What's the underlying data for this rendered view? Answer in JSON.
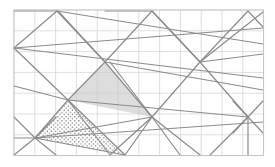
{
  "figure": {
    "caption": "",
    "background_color": "#ffffff",
    "canvas": {
      "width": 275,
      "height": 167
    }
  },
  "grid": {
    "label": "square-grid",
    "origin_x": 14,
    "origin_y": 10,
    "cell_size": 20.8,
    "columns": 12,
    "rows": 7,
    "right": 263.6,
    "bottom": 155.6,
    "line_color": "#d3d3d3",
    "line_width": 0.7,
    "border_color": "#bfbfbf",
    "border_width": 0.8
  },
  "lines": {
    "label": "lattice-lines",
    "color": "#8c8c8c",
    "width": 1.2,
    "segments": [
      {
        "name": "seg-1",
        "x1": 14,
        "y1": 48,
        "x2": 57,
        "y2": 11
      },
      {
        "name": "seg-2",
        "x1": 14,
        "y1": 48,
        "x2": 68,
        "y2": 100
      },
      {
        "name": "seg-3",
        "x1": 14,
        "y1": 48,
        "x2": 263,
        "y2": 28
      },
      {
        "name": "seg-4",
        "x1": 14,
        "y1": 48,
        "x2": 263,
        "y2": 78
      },
      {
        "name": "seg-5",
        "x1": 57,
        "y1": 11,
        "x2": 105,
        "y2": 62
      },
      {
        "name": "seg-6",
        "x1": 57,
        "y1": 11,
        "x2": 263,
        "y2": 44
      },
      {
        "name": "seg-7",
        "x1": 105,
        "y1": 62,
        "x2": 152,
        "y2": 11
      },
      {
        "name": "seg-8",
        "x1": 105,
        "y1": 62,
        "x2": 152,
        "y2": 117
      },
      {
        "name": "seg-9",
        "x1": 105,
        "y1": 62,
        "x2": 68,
        "y2": 100
      },
      {
        "name": "seg-10",
        "x1": 105,
        "y1": 62,
        "x2": 263,
        "y2": 90
      },
      {
        "name": "seg-11",
        "x1": 152,
        "y1": 11,
        "x2": 200,
        "y2": 62
      },
      {
        "name": "seg-12",
        "x1": 152,
        "y1": 11,
        "x2": 105,
        "y2": 11
      },
      {
        "name": "seg-13",
        "x1": 200,
        "y1": 62,
        "x2": 248,
        "y2": 11
      },
      {
        "name": "seg-14",
        "x1": 200,
        "y1": 62,
        "x2": 248,
        "y2": 117
      },
      {
        "name": "seg-15",
        "x1": 200,
        "y1": 62,
        "x2": 152,
        "y2": 117
      },
      {
        "name": "seg-16",
        "x1": 200,
        "y1": 62,
        "x2": 263,
        "y2": 54
      },
      {
        "name": "seg-17",
        "x1": 248,
        "y1": 11,
        "x2": 263,
        "y2": 27
      },
      {
        "name": "seg-18",
        "x1": 248,
        "y1": 117,
        "x2": 263,
        "y2": 101
      },
      {
        "name": "seg-19",
        "x1": 248,
        "y1": 117,
        "x2": 263,
        "y2": 133
      },
      {
        "name": "seg-20",
        "x1": 248,
        "y1": 117,
        "x2": 233,
        "y2": 101
      },
      {
        "name": "seg-21",
        "x1": 248,
        "y1": 117,
        "x2": 233,
        "y2": 133
      },
      {
        "name": "seg-22",
        "x1": 248,
        "y1": 117,
        "x2": 248,
        "y2": 155
      },
      {
        "name": "seg-23",
        "x1": 248,
        "y1": 117,
        "x2": 68,
        "y2": 100
      },
      {
        "name": "seg-24",
        "x1": 152,
        "y1": 117,
        "x2": 200,
        "y2": 155
      },
      {
        "name": "seg-25",
        "x1": 152,
        "y1": 117,
        "x2": 125,
        "y2": 155
      },
      {
        "name": "seg-26",
        "x1": 152,
        "y1": 117,
        "x2": 180,
        "y2": 155
      },
      {
        "name": "seg-27",
        "x1": 152,
        "y1": 117,
        "x2": 35,
        "y2": 138
      },
      {
        "name": "seg-28",
        "x1": 68,
        "y1": 100,
        "x2": 125,
        "y2": 155
      },
      {
        "name": "seg-29",
        "x1": 68,
        "y1": 100,
        "x2": 35,
        "y2": 138
      },
      {
        "name": "seg-30",
        "x1": 35,
        "y1": 138,
        "x2": 125,
        "y2": 155
      },
      {
        "name": "seg-31",
        "x1": 35,
        "y1": 138,
        "x2": 14,
        "y2": 117
      },
      {
        "name": "seg-32",
        "x1": 35,
        "y1": 138,
        "x2": 14,
        "y2": 155
      },
      {
        "name": "seg-33",
        "x1": 35,
        "y1": 138,
        "x2": 56,
        "y2": 117
      },
      {
        "name": "seg-34",
        "x1": 35,
        "y1": 138,
        "x2": 56,
        "y2": 155
      },
      {
        "name": "seg-35",
        "x1": 35,
        "y1": 138,
        "x2": 14,
        "y2": 138
      },
      {
        "name": "seg-36",
        "x1": 35,
        "y1": 138,
        "x2": 263,
        "y2": 122
      },
      {
        "name": "seg-37",
        "x1": 68,
        "y1": 100,
        "x2": 14,
        "y2": 86
      },
      {
        "name": "seg-38",
        "x1": 68,
        "y1": 100,
        "x2": 110,
        "y2": 155
      },
      {
        "name": "seg-39",
        "x1": 152,
        "y1": 117,
        "x2": 110,
        "y2": 62
      },
      {
        "name": "seg-40",
        "x1": 200,
        "y1": 62,
        "x2": 263,
        "y2": 12
      },
      {
        "name": "seg-41",
        "x1": 105,
        "y1": 62,
        "x2": 58,
        "y2": 11
      },
      {
        "name": "seg-42",
        "x1": 57,
        "y1": 11,
        "x2": 14,
        "y2": 11
      },
      {
        "name": "seg-43",
        "x1": 152,
        "y1": 11,
        "x2": 200,
        "y2": 62
      },
      {
        "name": "seg-44",
        "x1": 110,
        "y1": 155,
        "x2": 152,
        "y2": 117
      },
      {
        "name": "seg-45",
        "x1": 248,
        "y1": 117,
        "x2": 210,
        "y2": 155
      }
    ]
  },
  "highlighted_regions": [
    {
      "name": "gray-shaded-triangle",
      "fill_style": "solid-gray",
      "fill_color": "#c8c8c8",
      "opacity": 0.62,
      "vertices": [
        {
          "x": 105,
          "y": 62
        },
        {
          "x": 152,
          "y": 117
        },
        {
          "x": 68,
          "y": 100
        }
      ]
    },
    {
      "name": "stippled-triangle",
      "fill_style": "dotted",
      "dot_color": "#6e6e6e",
      "dot_spacing": 4.2,
      "dot_radius": 0.7,
      "vertices": [
        {
          "x": 68,
          "y": 100
        },
        {
          "x": 125,
          "y": 155
        },
        {
          "x": 35,
          "y": 138
        }
      ]
    }
  ],
  "nodes": {
    "label": "lattice-vertices",
    "color": "#7a7a7a",
    "points": [
      {
        "name": "node-left-mid",
        "x": 14,
        "y": 48
      },
      {
        "name": "node-top-left",
        "x": 57,
        "y": 11
      },
      {
        "name": "node-center-apex",
        "x": 105,
        "y": 62
      },
      {
        "name": "node-top-mid",
        "x": 152,
        "y": 11
      },
      {
        "name": "node-right-upper",
        "x": 200,
        "y": 62
      },
      {
        "name": "node-top-right",
        "x": 248,
        "y": 11
      },
      {
        "name": "node-center-low",
        "x": 152,
        "y": 117
      },
      {
        "name": "node-mid-left",
        "x": 68,
        "y": 100
      },
      {
        "name": "node-lower-left",
        "x": 35,
        "y": 138
      },
      {
        "name": "node-lower-right",
        "x": 248,
        "y": 117
      },
      {
        "name": "node-bottom-mid",
        "x": 125,
        "y": 155
      }
    ]
  }
}
